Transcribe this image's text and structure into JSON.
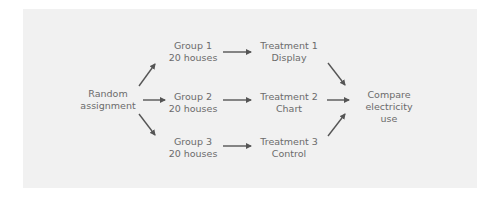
{
  "diagram": {
    "type": "flowchart",
    "colors": {
      "panel_background": "#f1f1f1",
      "text": "#6b6b6b",
      "arrow": "#555555"
    },
    "nodes": {
      "start": {
        "line1": "Random",
        "line2": "assignment"
      },
      "group1": {
        "line1": "Group 1",
        "line2": "20 houses"
      },
      "group2": {
        "line1": "Group 2",
        "line2": "20 houses"
      },
      "group3": {
        "line1": "Group 3",
        "line2": "20 houses"
      },
      "treatment1": {
        "line1": "Treatment 1",
        "line2": "Display"
      },
      "treatment2": {
        "line1": "Treatment 2",
        "line2": "Chart"
      },
      "treatment3": {
        "line1": "Treatment 3",
        "line2": "Control"
      },
      "end": {
        "line1": "Compare",
        "line2": "electricity",
        "line3": "use"
      }
    },
    "edges": [
      {
        "from": "start",
        "to": "group1"
      },
      {
        "from": "start",
        "to": "group2"
      },
      {
        "from": "start",
        "to": "group3"
      },
      {
        "from": "group1",
        "to": "treatment1"
      },
      {
        "from": "group2",
        "to": "treatment2"
      },
      {
        "from": "group3",
        "to": "treatment3"
      },
      {
        "from": "treatment1",
        "to": "end"
      },
      {
        "from": "treatment2",
        "to": "end"
      },
      {
        "from": "treatment3",
        "to": "end"
      }
    ]
  }
}
